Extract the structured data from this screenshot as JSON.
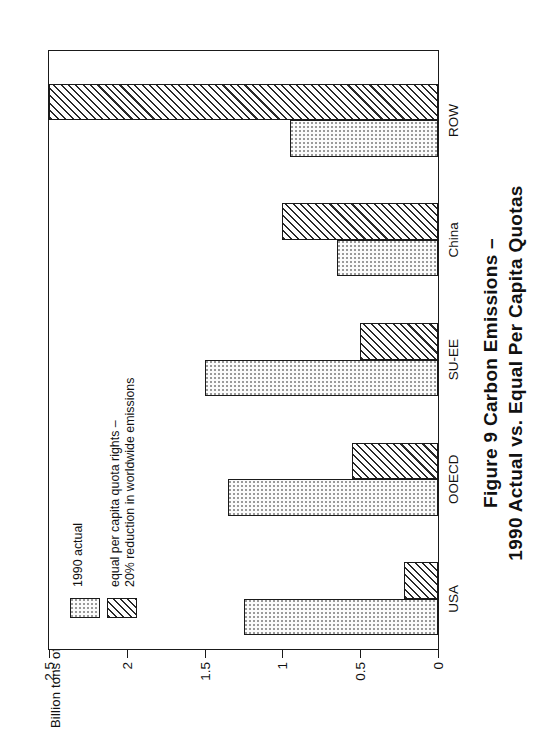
{
  "figure": {
    "caption_line1": "Figure 9   Carbon Emissions –",
    "caption_line2": "1990 Actual vs. Equal Per Capita Quotas",
    "axis_title": "Billion tons of carbon"
  },
  "legend": {
    "items": [
      {
        "swatch": "dotted-swatch",
        "label": "1990 actual"
      },
      {
        "swatch": "hatched-swatch",
        "label": "equal per capita quota rights –\n20% reduction in worldwide emissions"
      }
    ],
    "item0_label": "1990 actual",
    "item1_label_line1": "equal per capita quota rights –",
    "item1_label_line2": "20% reduction in worldwide emissions"
  },
  "chart_data": {
    "type": "bar",
    "title": "Figure 9   Carbon Emissions – 1990 Actual vs. Equal Per Capita Quotas",
    "xlabel": "",
    "ylabel": "Billion tons of carbon",
    "ylim": [
      0,
      2.5
    ],
    "yticks": [
      0,
      0.5,
      1,
      1.5,
      2,
      2.5
    ],
    "ytick_labels": [
      "0",
      "0.5",
      "1",
      "1.5",
      "2",
      "2.5"
    ],
    "grid": false,
    "legend_position": "upper-left",
    "orientation": "horizontal-printed-sideways",
    "categories": [
      "USA",
      "OOECD",
      "SU-EE",
      "China",
      "ROW"
    ],
    "series": [
      {
        "name": "1990 actual",
        "pattern": "dotted",
        "values": [
          1.25,
          1.35,
          1.5,
          0.65,
          0.95
        ]
      },
      {
        "name": "equal per capita quota rights – 20% reduction in worldwide emissions",
        "pattern": "hatched",
        "values": [
          0.22,
          0.55,
          0.5,
          1.0,
          2.5
        ]
      }
    ]
  }
}
